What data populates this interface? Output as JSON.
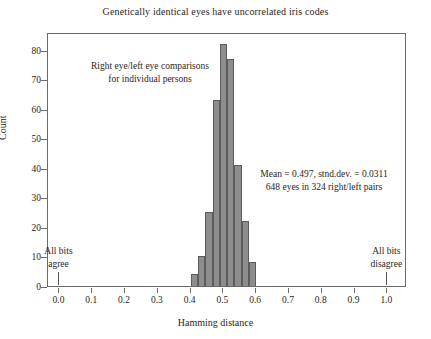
{
  "chart_data": {
    "type": "bar",
    "title": "Genetically identical eyes have uncorrelated iris codes",
    "xlabel": "Hamming distance",
    "ylabel": "Count",
    "xlim": [
      -0.035,
      1.06
    ],
    "ylim": [
      0,
      86
    ],
    "grid": false,
    "legend": null,
    "bin_width": 0.0222,
    "x": [
      0.411,
      0.433,
      0.456,
      0.478,
      0.5,
      0.522,
      0.544,
      0.567,
      0.589
    ],
    "bin_edges": [
      0.4,
      0.422,
      0.444,
      0.467,
      0.489,
      0.511,
      0.533,
      0.556,
      0.578,
      0.6
    ],
    "values": [
      4,
      10,
      25,
      63,
      82,
      77,
      41,
      22,
      8
    ],
    "categories": [
      "0.400-0.422",
      "0.422-0.444",
      "0.444-0.467",
      "0.467-0.489",
      "0.489-0.511",
      "0.511-0.533",
      "0.533-0.556",
      "0.556-0.578",
      "0.578-0.600"
    ],
    "xticks": [
      0.0,
      0.1,
      0.2,
      0.3,
      0.4,
      0.5,
      0.6,
      0.7,
      0.8,
      0.9,
      1.0
    ],
    "xtick_labels": [
      "0.0",
      "0.1",
      "0.2",
      "0.3",
      "0.4",
      "0.5",
      "0.6",
      "0.7",
      "0.8",
      "0.9",
      "1.0"
    ],
    "yticks": [
      0,
      10,
      20,
      30,
      40,
      50,
      60,
      70,
      80
    ],
    "ytick_labels": [
      "0",
      "10",
      "20",
      "30",
      "40",
      "50",
      "60",
      "70",
      "80"
    ],
    "bar_color": "#8d8d8d",
    "bar_edge_color": "#5d5c5c",
    "annotations": [
      {
        "text": "Right eye/left eye comparisons for individual persons",
        "x": 0.17,
        "y": 72
      },
      {
        "text": "Mean = 0.497,  stnd.dev. = 0.0311 648 eyes in 324 right/left pairs",
        "x": 0.66,
        "y": 38
      },
      {
        "text": "All bits agree",
        "x": 0.0,
        "y": 10
      },
      {
        "text": "All bits disagree",
        "x": 1.0,
        "y": 10
      }
    ]
  },
  "title": "Genetically identical eyes have uncorrelated iris codes",
  "axes": {
    "x_label": "Hamming distance",
    "y_label": "Count",
    "x_ticks": [
      "0.0",
      "0.1",
      "0.2",
      "0.3",
      "0.4",
      "0.5",
      "0.6",
      "0.7",
      "0.8",
      "0.9",
      "1.0"
    ],
    "y_ticks": [
      "80",
      "70",
      "60",
      "50",
      "40",
      "30",
      "20",
      "10",
      "0"
    ]
  },
  "annotations": {
    "comparison_line1": "Right eye/left eye comparisons",
    "comparison_line2": "for individual persons",
    "stats_line1": "Mean = 0.497,  stnd.dev. = 0.0311",
    "stats_line2": "648 eyes in 324 right/left pairs",
    "agree_line1": "All bits",
    "agree_line2": "agree",
    "disagree_line1": "All bits",
    "disagree_line2": "disagree"
  }
}
